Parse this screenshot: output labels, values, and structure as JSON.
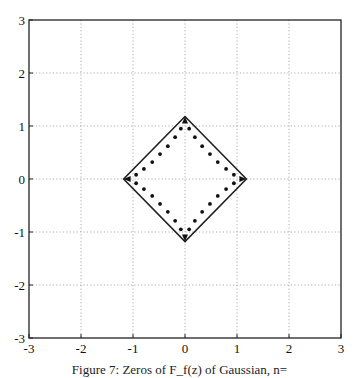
{
  "chart_data": {
    "type": "scatter",
    "title": "",
    "caption": "Figure 7: Zeros of F_f(z) of Gaussian, n=",
    "xlabel": "",
    "ylabel": "",
    "xlim": [
      -3,
      3
    ],
    "ylim": [
      -3,
      3
    ],
    "xticks": [
      -3,
      -2,
      -1,
      0,
      1,
      2,
      3
    ],
    "yticks": [
      -3,
      -2,
      -1,
      0,
      1,
      2,
      3
    ],
    "grid": true,
    "legend": null,
    "series": [
      {
        "name": "boundary",
        "style": "line",
        "color": "#222222",
        "points": [
          [
            0,
            1.18
          ],
          [
            1.18,
            0
          ],
          [
            0,
            -1.18
          ],
          [
            -1.18,
            0
          ],
          [
            0,
            1.18
          ]
        ]
      },
      {
        "name": "zeros",
        "style": "dots",
        "color": "#111111",
        "points": [
          [
            0.08,
            0.95
          ],
          [
            0.19,
            0.79
          ],
          [
            0.33,
            0.62
          ],
          [
            0.48,
            0.47
          ],
          [
            0.63,
            0.32
          ],
          [
            0.79,
            0.19
          ],
          [
            0.94,
            0.08
          ],
          [
            -0.08,
            0.95
          ],
          [
            -0.19,
            0.79
          ],
          [
            -0.33,
            0.62
          ],
          [
            -0.48,
            0.47
          ],
          [
            -0.63,
            0.32
          ],
          [
            -0.79,
            0.19
          ],
          [
            -0.94,
            0.08
          ],
          [
            0.08,
            -0.95
          ],
          [
            0.19,
            -0.79
          ],
          [
            0.33,
            -0.62
          ],
          [
            0.48,
            -0.47
          ],
          [
            0.63,
            -0.32
          ],
          [
            0.79,
            -0.19
          ],
          [
            0.94,
            -0.08
          ],
          [
            -0.08,
            -0.95
          ],
          [
            -0.19,
            -0.79
          ],
          [
            -0.33,
            -0.62
          ],
          [
            -0.48,
            -0.47
          ],
          [
            -0.63,
            -0.32
          ],
          [
            -0.79,
            -0.19
          ],
          [
            -0.94,
            -0.08
          ]
        ]
      },
      {
        "name": "vertex-arrows",
        "style": "arrow",
        "color": "#111111",
        "points": [
          [
            0,
            1.18
          ],
          [
            1.18,
            0
          ],
          [
            0,
            -1.18
          ],
          [
            -1.18,
            0
          ]
        ]
      }
    ]
  },
  "layout": {
    "plot_left": 29,
    "plot_right": 341,
    "plot_top": 20,
    "plot_bottom": 338
  }
}
